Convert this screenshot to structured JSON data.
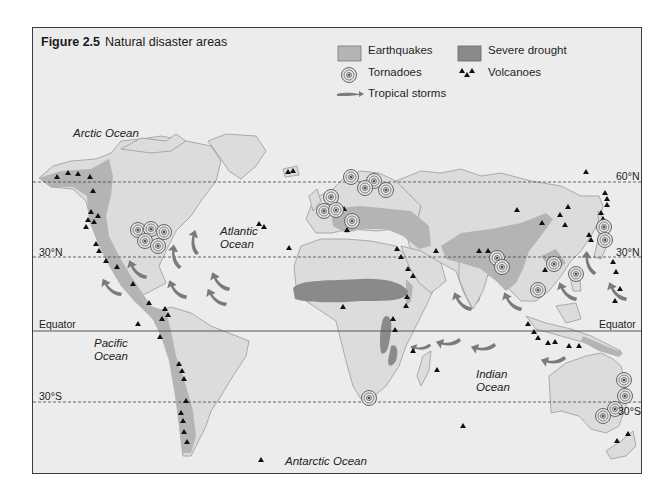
{
  "figure": {
    "number": "Figure 2.5",
    "title": "Natural disaster areas"
  },
  "legend": {
    "earthquakes": "Earthquakes",
    "severe_drought": "Severe drought",
    "tornadoes": "Tornadoes",
    "volcanoes": "Volcanoes",
    "tropical_storms": "Tropical storms"
  },
  "colors": {
    "background": "#ececec",
    "land": "#dcdcdc",
    "coastline": "#9a9a9a",
    "earthquake_zone": "#b4b4b4",
    "drought_zone": "#8a8a8a",
    "storm_arrow": "#7a7a7a",
    "volcano": "#111111",
    "frame": "#3a3a3a"
  },
  "oceans": {
    "arctic": "Arctic Ocean",
    "atlantic_line1": "Atlantic",
    "atlantic_line2": "Ocean",
    "pacific_line1": "Pacific",
    "pacific_line2": "Ocean",
    "indian_line1": "Indian",
    "indian_line2": "Ocean",
    "antarctic": "Antarctic Ocean"
  },
  "latitudes": {
    "n60": "60°N",
    "n30_left": "30°N",
    "n30_right": "30°N",
    "equator_left": "Equator",
    "equator_right": "Equator",
    "s30_left": "30°S",
    "s30_right": "30°S"
  },
  "map_elements": {
    "tornado_count": 24,
    "volcano_count": 64,
    "tropical_storm_arrow_count": 16
  }
}
